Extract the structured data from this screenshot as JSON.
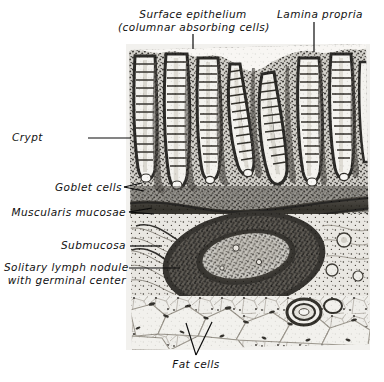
{
  "figure": {
    "kind": "histology-micrograph",
    "title_alt": "Mucosa of small intestine",
    "plate": {
      "x": 126,
      "y": 44,
      "width": 244,
      "height": 306,
      "background": "#f2f1ee",
      "ink": "#1c1b19"
    },
    "labels": [
      {
        "id": "surface-epithelium",
        "lines": [
          "Surface epithelium",
          "(columnar absorbing cells)"
        ],
        "align": "center",
        "x": 118,
        "y": 8,
        "w": 150,
        "leader": {
          "x1": 193,
          "y1": 34,
          "x2": 193,
          "y2": 46
        }
      },
      {
        "id": "lamina-propria",
        "lines": [
          "Lamina propria"
        ],
        "align": "center",
        "x": 268,
        "y": 8,
        "w": 104,
        "leader": {
          "x1": 314,
          "y1": 22,
          "x2": 314,
          "y2": 50
        }
      },
      {
        "id": "crypt",
        "lines": [
          "Crypt"
        ],
        "align": "left",
        "x": 12,
        "y": 131,
        "w": 60,
        "leader": {
          "x1": 88,
          "y1": 138,
          "x2": 131,
          "y2": 138
        }
      },
      {
        "id": "goblet-cells",
        "lines": [
          "Goblet cells"
        ],
        "align": "right",
        "x": 30,
        "y": 182,
        "w": 90,
        "leader": {
          "x1": 124,
          "y1": 188,
          "x2": 143,
          "y2": 191
        }
      },
      {
        "id": "muscularis-mucosae",
        "lines": [
          "Muscularis mucosae"
        ],
        "align": "right",
        "x": 10,
        "y": 207,
        "w": 116,
        "leader": {
          "x1": 129,
          "y1": 213,
          "x2": 152,
          "y2": 214
        }
      },
      {
        "id": "submucosa",
        "lines": [
          "Submucosa"
        ],
        "align": "right",
        "x": 48,
        "y": 240,
        "w": 78,
        "leader": {
          "x1": 130,
          "y1": 246,
          "x2": 160,
          "y2": 246
        }
      },
      {
        "id": "solitary-lymph-nodule",
        "lines": [
          "Solitary lymph nodule",
          "with germinal center"
        ],
        "align": "right",
        "x": 4,
        "y": 261,
        "w": 122,
        "leader": {
          "x1": 129,
          "y1": 268,
          "x2": 178,
          "y2": 268
        }
      },
      {
        "id": "fat-cells",
        "lines": [
          "Fat cells"
        ],
        "align": "center",
        "x": 165,
        "y": 358,
        "w": 60,
        "leader": null
      }
    ],
    "pointers": [
      {
        "id": "fat-cells-fork-left",
        "x1": 196,
        "y1": 356,
        "x2": 186,
        "y2": 324
      },
      {
        "id": "fat-cells-fork-right",
        "x1": 196,
        "y1": 356,
        "x2": 212,
        "y2": 323
      }
    ]
  }
}
